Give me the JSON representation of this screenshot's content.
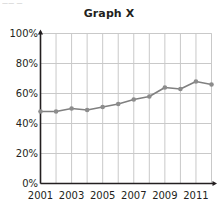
{
  "top_crop_remnant": "—— —",
  "chart_data": {
    "type": "line",
    "title": "Graph X",
    "xlabel": "",
    "ylabel": "",
    "x": [
      2001,
      2002,
      2003,
      2004,
      2005,
      2006,
      2007,
      2008,
      2009,
      2010,
      2011,
      2012
    ],
    "values": [
      48,
      48,
      50,
      49,
      51,
      53,
      56,
      58,
      64,
      63,
      68,
      66
    ],
    "series": [
      {
        "name": "Graph X",
        "values": [
          48,
          48,
          50,
          49,
          51,
          53,
          56,
          58,
          64,
          63,
          68,
          66
        ]
      }
    ],
    "ylim": [
      0,
      100
    ],
    "xlim": [
      2001,
      2012
    ],
    "ytick_labels": [
      "0%",
      "20%",
      "40%",
      "60%",
      "80%",
      "100%"
    ],
    "ytick_values": [
      0,
      20,
      40,
      60,
      80,
      100
    ],
    "xtick_labels": [
      "2001",
      "2003",
      "2005",
      "2007",
      "2009",
      "2011"
    ],
    "xtick_values": [
      2001,
      2003,
      2005,
      2007,
      2009,
      2011
    ],
    "grid": true,
    "legend": false,
    "line_color": "#808080",
    "marker_color": "#8c8c8c",
    "grid_color": "#c9c9c9",
    "axis_color": "#231f20",
    "marker": "circle"
  }
}
